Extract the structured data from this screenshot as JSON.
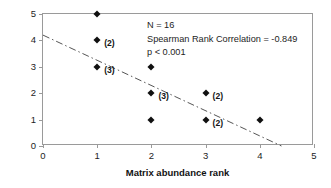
{
  "chart_data": {
    "type": "scatter",
    "title": "",
    "xlabel": "Matrix abundance rank",
    "ylabel": "Extinction proneness rank",
    "xlim": [
      0,
      5
    ],
    "ylim": [
      0,
      5
    ],
    "xticks": [
      "0",
      "1",
      "2",
      "3",
      "4",
      "5"
    ],
    "yticks": [
      "0",
      "1",
      "2",
      "3",
      "4",
      "5"
    ],
    "grid": false,
    "legend": "none",
    "points": [
      {
        "x": 1,
        "y": 5,
        "count_label": ""
      },
      {
        "x": 1,
        "y": 4,
        "count_label": "(2)"
      },
      {
        "x": 1,
        "y": 3,
        "count_label": "(3)"
      },
      {
        "x": 2,
        "y": 3,
        "count_label": ""
      },
      {
        "x": 2,
        "y": 2,
        "count_label": "(3)"
      },
      {
        "x": 2,
        "y": 1,
        "count_label": ""
      },
      {
        "x": 3,
        "y": 2,
        "count_label": "(2)"
      },
      {
        "x": 3,
        "y": 1,
        "count_label": "(2)"
      },
      {
        "x": 4,
        "y": 1,
        "count_label": ""
      }
    ],
    "trend_line": {
      "style": "dash-dot",
      "x0": 0,
      "y0": 4.2,
      "x1": 4.4,
      "y1": 0,
      "color": "#555555"
    },
    "annotations": {
      "n": "N = 16",
      "correlation": "Spearman Rank Correlation = -0.849",
      "pvalue": "p < 0.001"
    },
    "colors": {
      "marker": "#101010",
      "axis": "#9a9a9a",
      "text": "#1d1d1d",
      "background": "#ffffff"
    }
  }
}
